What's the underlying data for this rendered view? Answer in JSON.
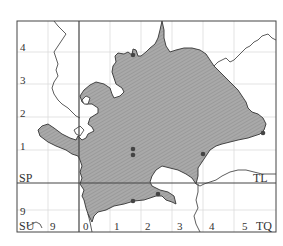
{
  "map": {
    "grid_squares": {
      "sp": "SP",
      "tl": "TL",
      "su": "SU",
      "tq": "TQ"
    },
    "y_axis_labels": [
      "4",
      "3",
      "2",
      "1",
      "9"
    ],
    "x_axis_labels": [
      "9",
      "0",
      "1",
      "2",
      "3",
      "4",
      "5"
    ],
    "colors": {
      "fill": "#a8a8a8",
      "hatch": "#8a8a8a",
      "border": "#333333",
      "gridline": "#d8d8d8",
      "frame": "#444444",
      "record_dot": "#444444"
    },
    "record_dots": [
      {
        "x": 133,
        "y": 55
      },
      {
        "x": 133,
        "y": 149
      },
      {
        "x": 133,
        "y": 155
      },
      {
        "x": 203,
        "y": 154
      },
      {
        "x": 263,
        "y": 133
      },
      {
        "x": 133,
        "y": 201
      },
      {
        "x": 158,
        "y": 194
      }
    ]
  }
}
